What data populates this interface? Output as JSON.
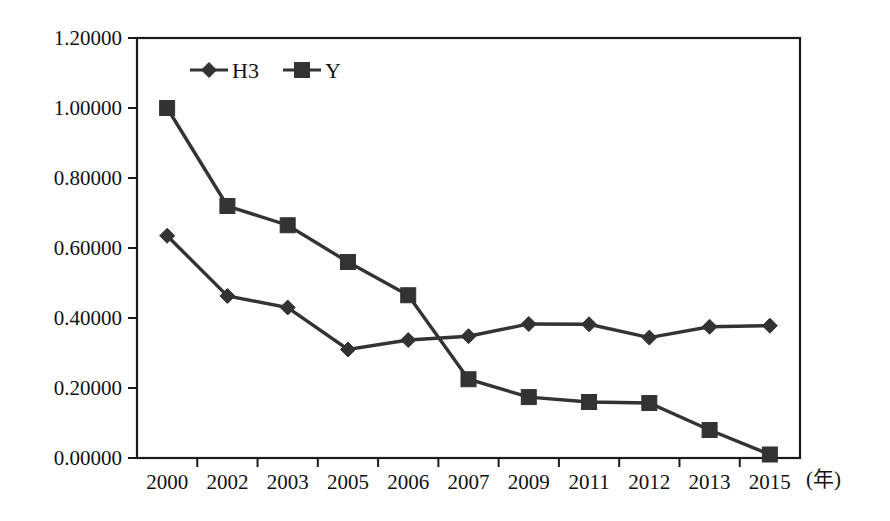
{
  "chart_data": {
    "type": "line",
    "title": "",
    "xlabel": "(年)",
    "ylabel": "",
    "categories": [
      "2000",
      "2002",
      "2003",
      "2005",
      "2006",
      "2007",
      "2009",
      "2011",
      "2012",
      "2013",
      "2015"
    ],
    "series": [
      {
        "name": "H3",
        "marker": "diamond",
        "color": "#333333",
        "values": [
          0.635,
          0.463,
          0.43,
          0.31,
          0.337,
          0.348,
          0.383,
          0.382,
          0.344,
          0.375,
          0.378
        ]
      },
      {
        "name": "Y",
        "marker": "square",
        "color": "#333333",
        "values": [
          1.0,
          0.72,
          0.665,
          0.56,
          0.465,
          0.225,
          0.174,
          0.16,
          0.157,
          0.08,
          0.01
        ]
      }
    ],
    "ylim": [
      0.0,
      1.2
    ],
    "ytick_step": 0.2,
    "ytick_labels": [
      "0.00000",
      "0.20000",
      "0.40000",
      "0.60000",
      "0.80000",
      "1.00000",
      "1.20000"
    ],
    "ytick_values": [
      0.0,
      0.2,
      0.4,
      0.6,
      0.8,
      1.0,
      1.2
    ],
    "grid": false,
    "legend_position": "top-left-inside",
    "legend_entries": [
      "H3",
      "Y"
    ],
    "axis_unit": "(年)"
  }
}
